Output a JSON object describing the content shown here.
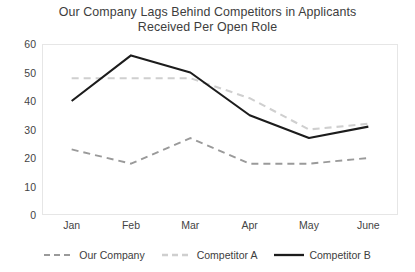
{
  "chart_data": {
    "type": "line",
    "title": "Our Company Lags Behind Competitors in Applicants Received Per Open Role",
    "title_line1": "Our Company Lags Behind Competitors in Applicants",
    "title_line2": "Received Per Open Role",
    "xlabel": "",
    "ylabel": "",
    "categories": [
      "Jan",
      "Feb",
      "Mar",
      "Apr",
      "May",
      "June"
    ],
    "ylim": [
      0,
      60
    ],
    "yticks": [
      0,
      10,
      20,
      30,
      40,
      50,
      60
    ],
    "grid": false,
    "legend_position": "bottom",
    "series": [
      {
        "name": "Our Company",
        "values": [
          23,
          18,
          27,
          18,
          18,
          20
        ],
        "color": "#9a9a9a",
        "style": "dashed",
        "width": 1.9
      },
      {
        "name": "Competitor A",
        "values": [
          48,
          48,
          48,
          41,
          30,
          32
        ],
        "color": "#cfcfcf",
        "style": "dashed",
        "width": 2.1
      },
      {
        "name": "Competitor B",
        "values": [
          40,
          56,
          50,
          35,
          27,
          31
        ],
        "color": "#1c1c1c",
        "style": "solid",
        "width": 2.1
      }
    ]
  },
  "colors": {
    "background": "#ffffff",
    "frame": "#e6e6e6",
    "text": "#3d3d3d"
  }
}
